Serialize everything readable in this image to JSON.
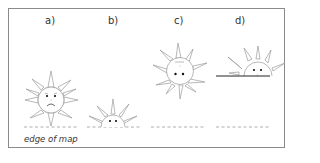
{
  "figure": {
    "panels": [
      {
        "id": "a",
        "label": "a)",
        "sun_state": "full-sun-above-edge-frowning",
        "horizon": "dashed"
      },
      {
        "id": "b",
        "label": "b)",
        "sun_state": "half-sun-at-edge",
        "horizon": "dashed"
      },
      {
        "id": "c",
        "label": "c)",
        "sun_state": "full-sun-high",
        "horizon": "dashed"
      },
      {
        "id": "d",
        "label": "d)",
        "sun_state": "half-sun-on-solid-line",
        "horizon": "dashed"
      }
    ],
    "caption": "edge of map",
    "colors": {
      "line": "#888888",
      "frame": "#8a8a8a",
      "face": "#111111",
      "text": "#333333"
    }
  }
}
